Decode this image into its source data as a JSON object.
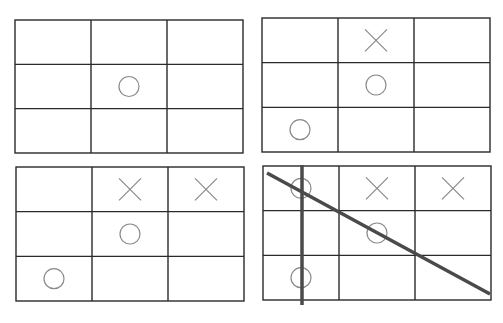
{
  "diagram": {
    "type": "tic-tac-toe-sequence",
    "colors": {
      "grid": "#2a2a2a",
      "mark": "#8a8a8a",
      "strike": "#4a4a4a",
      "background": "#ffffff"
    },
    "boards": [
      {
        "id": "board-1",
        "x": 15,
        "y": 20,
        "w": 228,
        "h": 133,
        "cells": [
          [
            "",
            "",
            ""
          ],
          [
            "",
            "O",
            ""
          ],
          [
            "",
            "",
            ""
          ]
        ]
      },
      {
        "id": "board-2",
        "x": 262,
        "y": 18,
        "w": 228,
        "h": 134,
        "cells": [
          [
            "",
            "X",
            ""
          ],
          [
            "",
            "O",
            ""
          ],
          [
            "O",
            "",
            ""
          ]
        ]
      },
      {
        "id": "board-3",
        "x": 16,
        "y": 167,
        "w": 228,
        "h": 134,
        "cells": [
          [
            "",
            "X",
            "X"
          ],
          [
            "",
            "O",
            ""
          ],
          [
            "O",
            "",
            ""
          ]
        ]
      },
      {
        "id": "board-4",
        "x": 263,
        "y": 166,
        "w": 228,
        "h": 134,
        "cells": [
          [
            "O",
            "X",
            "X"
          ],
          [
            "",
            "O",
            ""
          ],
          [
            "O",
            "",
            ""
          ]
        ],
        "strikes": [
          {
            "name": "vertical-strike-line",
            "x1": 302,
            "y1": 165,
            "x2": 302,
            "y2": 305
          },
          {
            "name": "diagonal-strike-line",
            "x1": 267,
            "y1": 173,
            "x2": 490,
            "y2": 294
          }
        ]
      }
    ]
  }
}
